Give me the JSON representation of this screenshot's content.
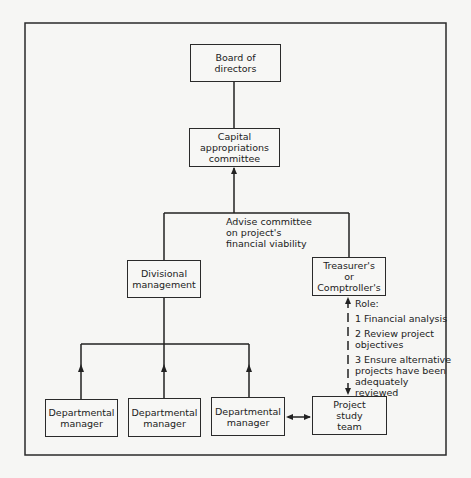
{
  "diagram": {
    "type": "organizational-flowchart",
    "nodes": {
      "board": "Board of\ndirectors",
      "capital": "Capital\nappropriations\ncommittee",
      "divisional": "Divisional\nmanagement",
      "treasurer": "Treasurer's\nor\nComptroller's",
      "dept1": "Departmental\nmanager",
      "dept2": "Departmental\nmanager",
      "dept3": "Departmental\nmanager",
      "project_team": "Project\nstudy\nteam"
    },
    "annotations": {
      "advise": "Advise committee\non project's\nfinancial viability",
      "role_title": "Role:",
      "role_items": [
        "1 Financial analysis",
        "2 Review project\n   objectives",
        "3 Ensure alternative\n   projects have been\n   adequately\n   reviewed"
      ]
    },
    "edges": [
      {
        "from": "board",
        "to": "capital",
        "style": "solid",
        "arrow": "none"
      },
      {
        "from": "divisional",
        "to": "capital",
        "style": "solid",
        "arrow": "to"
      },
      {
        "from": "treasurer",
        "to": "capital",
        "style": "solid",
        "arrow": "to"
      },
      {
        "from": "dept1",
        "to": "divisional",
        "style": "solid",
        "arrow": "to"
      },
      {
        "from": "dept2",
        "to": "divisional",
        "style": "solid",
        "arrow": "to"
      },
      {
        "from": "dept3",
        "to": "divisional",
        "style": "solid",
        "arrow": "to"
      },
      {
        "from": "dept3",
        "to": "project_team",
        "style": "solid",
        "arrow": "both"
      },
      {
        "from": "treasurer",
        "to": "project_team",
        "style": "dashed",
        "arrow": "both"
      }
    ]
  }
}
